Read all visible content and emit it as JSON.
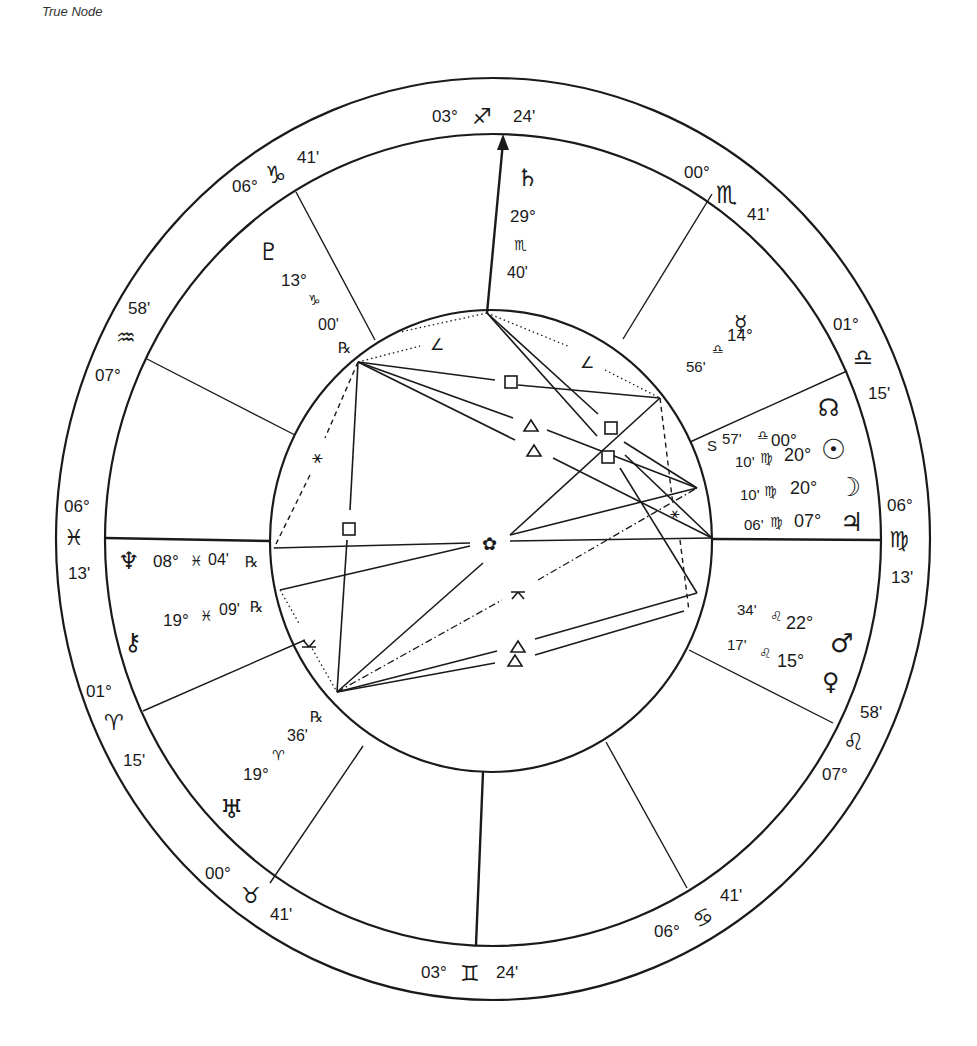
{
  "caption": "True Node",
  "chart": {
    "type": "natal-wheel",
    "house_cusps": [
      {
        "id": "asc-west",
        "deg": "06°",
        "sign": "♓",
        "sign_name": "pisces",
        "min": "13'"
      },
      {
        "id": "h2",
        "deg": "01°",
        "sign": "♈",
        "sign_name": "aries",
        "min": "15'"
      },
      {
        "id": "h3",
        "deg": "00°",
        "sign": "♉",
        "sign_name": "taurus",
        "min": "41'"
      },
      {
        "id": "ic",
        "deg": "03°",
        "sign": "♊",
        "sign_name": "gemini",
        "min": "24'"
      },
      {
        "id": "h5",
        "deg": "06°",
        "sign": "♋",
        "sign_name": "cancer",
        "min": "41'"
      },
      {
        "id": "h6",
        "deg": "07°",
        "sign": "♌",
        "sign_name": "leo",
        "min": "58'"
      },
      {
        "id": "desc-east",
        "deg": "06°",
        "sign": "♍",
        "sign_name": "virgo",
        "min": "13'"
      },
      {
        "id": "h8",
        "deg": "01°",
        "sign": "♎",
        "sign_name": "libra",
        "min": "15'"
      },
      {
        "id": "h9",
        "deg": "00°",
        "sign": "♏",
        "sign_name": "scorpio",
        "min": "41'"
      },
      {
        "id": "mc",
        "deg": "03°",
        "sign": "♐",
        "sign_name": "sagittarius",
        "min": "24'"
      },
      {
        "id": "h11",
        "deg": "06°",
        "sign": "♑",
        "sign_name": "capricorn",
        "min": "41'"
      },
      {
        "id": "h12",
        "deg": "07°",
        "sign": "♒",
        "sign_name": "aquarius",
        "min": "58'"
      }
    ],
    "planets": [
      {
        "name": "saturn",
        "glyph": "♄",
        "deg": "29°",
        "sign": "♏",
        "min": "40'",
        "retro": ""
      },
      {
        "name": "pluto",
        "glyph": "♇",
        "deg": "13°",
        "sign": "♑",
        "min": "00'",
        "retro": "℞"
      },
      {
        "name": "mercury",
        "glyph": "☿",
        "deg": "14°",
        "sign": "♎",
        "min": "56'",
        "retro": ""
      },
      {
        "name": "north-node",
        "glyph": "☊",
        "deg": "00°",
        "sign": "♎",
        "min": "57'",
        "retro": "",
        "prefix": "S"
      },
      {
        "name": "sun",
        "glyph": "☉",
        "deg": "20°",
        "sign": "♍",
        "min": "10'",
        "retro": ""
      },
      {
        "name": "moon",
        "glyph": "☽",
        "deg": "20°",
        "sign": "♍",
        "min": "10'",
        "retro": ""
      },
      {
        "name": "jupiter",
        "glyph": "♃",
        "deg": "07°",
        "sign": "♍",
        "min": "06'",
        "retro": ""
      },
      {
        "name": "mars",
        "glyph": "♂",
        "deg": "22°",
        "sign": "♌",
        "min": "34'",
        "retro": ""
      },
      {
        "name": "venus",
        "glyph": "♀",
        "deg": "15°",
        "sign": "♌",
        "min": "17'",
        "retro": ""
      },
      {
        "name": "neptune",
        "glyph": "♆",
        "deg": "08°",
        "sign": "♓",
        "min": "04'",
        "retro": "℞"
      },
      {
        "name": "chiron",
        "glyph": "⚷",
        "deg": "19°",
        "sign": "♓",
        "min": "09'",
        "retro": "℞"
      },
      {
        "name": "uranus",
        "glyph": "♅",
        "deg": "19°",
        "sign": "♈",
        "min": "36'",
        "retro": "℞"
      }
    ],
    "aspect_glyphs": {
      "square": "□",
      "trine": "△",
      "sextile": "⚹",
      "semisextile": "⚺",
      "semisquare": "∠",
      "quincunx": "⚻"
    },
    "center_glyph": "✿",
    "colors": {
      "line": "#1a1a1a",
      "background": "#ffffff"
    }
  }
}
